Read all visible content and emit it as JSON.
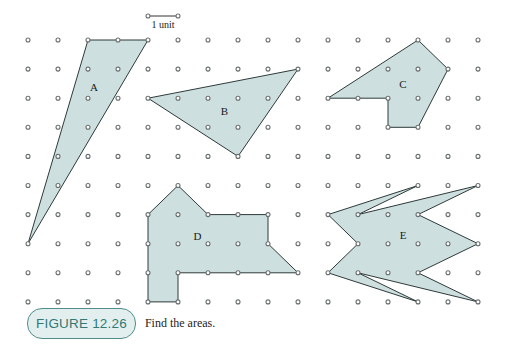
{
  "figure": {
    "caption_label": "FIGURE 12.26",
    "caption_text": "Find the areas.",
    "scale": {
      "label": "1 unit",
      "units": 1
    },
    "colors": {
      "fill": "#cddfde",
      "stroke": "#2e3a3a",
      "dot": "#6a6f70",
      "badge_text": "#2f7976",
      "badge_bg": "#e3efee",
      "badge_border": "#4f8e8b"
    },
    "grid": {
      "columns": 16,
      "rows": 10,
      "origin_x": 28,
      "origin_y": 40,
      "spacing_x": 30,
      "spacing_y": 29.1
    },
    "shapes": [
      {
        "name": "A",
        "label_pos": [
          2.2,
          1.6
        ],
        "vertices": [
          [
            2,
            0
          ],
          [
            4,
            0
          ],
          [
            0,
            7
          ]
        ]
      },
      {
        "name": "B",
        "label_pos": [
          6.55,
          2.45
        ],
        "vertices": [
          [
            4,
            2
          ],
          [
            9,
            1
          ],
          [
            7,
            4
          ]
        ]
      },
      {
        "name": "C",
        "label_pos": [
          12.5,
          1.5
        ],
        "vertices": [
          [
            10,
            2
          ],
          [
            13,
            0
          ],
          [
            14,
            1
          ],
          [
            13,
            3
          ],
          [
            12,
            3
          ],
          [
            12,
            2
          ]
        ]
      },
      {
        "name": "D",
        "label_pos": [
          5.65,
          6.75
        ],
        "vertices": [
          [
            5,
            5
          ],
          [
            6,
            6
          ],
          [
            8,
            6
          ],
          [
            8,
            7
          ],
          [
            9,
            8
          ],
          [
            5,
            8
          ],
          [
            5,
            9
          ],
          [
            4,
            9
          ],
          [
            4,
            6
          ]
        ]
      },
      {
        "name": "E",
        "label_pos": [
          12.5,
          6.7
        ],
        "vertices": [
          [
            10,
            6
          ],
          [
            13,
            5
          ],
          [
            11,
            6
          ],
          [
            15,
            5
          ],
          [
            13,
            6
          ],
          [
            15,
            7
          ],
          [
            13,
            8
          ],
          [
            15,
            9
          ],
          [
            11,
            8
          ],
          [
            13,
            9
          ],
          [
            10,
            8
          ],
          [
            11,
            7
          ]
        ]
      }
    ]
  }
}
